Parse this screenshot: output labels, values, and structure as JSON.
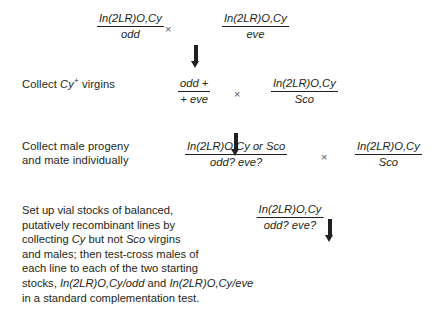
{
  "figure": {
    "background": "#ffffff",
    "text_color": "#231f20",
    "times_symbol": "×",
    "arrow_glyph": "down-arrow"
  },
  "row1": {
    "cross_left": {
      "numerator": "In(2LR)O,Cy",
      "denominator": "odd"
    },
    "operator": "×",
    "cross_right": {
      "numerator": "In(2LR)O,Cy",
      "denominator": "eve"
    }
  },
  "row2": {
    "instruction_pre": "Collect ",
    "instruction_italic": "Cy",
    "instruction_sup": "+",
    "instruction_post": " virgins",
    "cross_left": {
      "numerator": "odd +",
      "denominator": "+ eve"
    },
    "operator": "×",
    "cross_right": {
      "numerator": "In(2LR)O,Cy",
      "denominator": "Sco"
    }
  },
  "row3": {
    "instruction": "Collect male progeny\nand mate individually",
    "cross_left": {
      "numerator": "In(2LR)O,Cy or Sco",
      "denominator": "odd? eve?"
    },
    "operator": "×",
    "cross_right": {
      "numerator": "In(2LR)O,Cy",
      "denominator": "Sco"
    }
  },
  "row4": {
    "result": {
      "numerator": "In(2LR)O,Cy",
      "denominator": "odd? eve?"
    }
  },
  "caption": {
    "line1": "Set up vial stocks of balanced,",
    "line2": "putatively recombinant lines by",
    "line3_a": "collecting ",
    "line3_i1": "Cy",
    "line3_b": " but not ",
    "line3_i2": "Sco",
    "line3_c": " virgins",
    "line4": "and males; then test-cross males of",
    "line5": "each line to each of the two starting",
    "line6_a": "stocks, ",
    "line6_i1": "In(2LR)O,Cy/odd",
    "line6_b": " and ",
    "line6_i2": "In(2LR)O,Cy/eve",
    "line7": "in a standard complementation test."
  }
}
